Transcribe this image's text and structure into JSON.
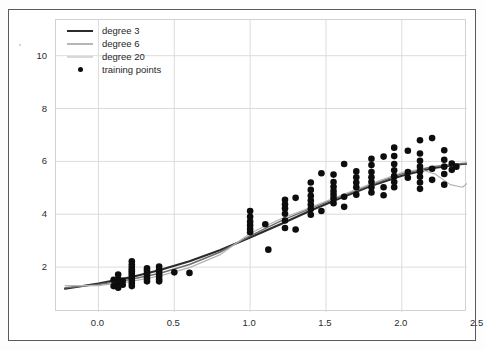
{
  "chart_data": {
    "type": "scatter",
    "title": "",
    "xlabel": "",
    "ylabel": "",
    "xlim": [
      -0.28,
      2.43
    ],
    "ylim": [
      0.3,
      11.35
    ],
    "xticks": [
      0.0,
      0.5,
      1.0,
      1.5,
      2.0,
      2.5
    ],
    "xtick_labels": [
      "0.0",
      "0.5",
      "1.0",
      "1.5",
      "2.0",
      "2.5"
    ],
    "yticks": [
      2,
      4,
      6,
      8,
      10
    ],
    "ytick_labels": [
      "2",
      "4",
      "6",
      "8",
      "10"
    ],
    "grid": true,
    "legend_position": "upper left",
    "legend": [
      {
        "label": "degree 3",
        "color": "#2b2b2b",
        "width": 2.1,
        "marker": "line"
      },
      {
        "label": "degree 6",
        "color": "#6e6e6e",
        "width": 1.5,
        "marker": "line"
      },
      {
        "label": "degree 20",
        "color": "#b4b4b4",
        "width": 1.2,
        "marker": "line"
      },
      {
        "label": "training points",
        "color": "#0d0d0d",
        "marker": "point"
      }
    ],
    "scatter": {
      "name": "training points",
      "color": "#0d0d0d",
      "size": 4.6,
      "x": [
        0.1,
        0.1,
        0.13,
        0.13,
        0.13,
        0.13,
        0.16,
        0.16,
        0.22,
        0.22,
        0.22,
        0.22,
        0.22,
        0.22,
        0.22,
        0.22,
        0.22,
        0.22,
        0.22,
        0.32,
        0.32,
        0.32,
        0.32,
        0.32,
        0.32,
        0.4,
        0.4,
        0.4,
        0.4,
        0.4,
        0.4,
        0.4,
        0.5,
        0.6,
        1.0,
        1.0,
        1.0,
        1.0,
        1.0,
        1.0,
        1.1,
        1.12,
        1.23,
        1.23,
        1.23,
        1.23,
        1.23,
        1.23,
        1.3,
        1.3,
        1.4,
        1.4,
        1.4,
        1.4,
        1.4,
        1.4,
        1.4,
        1.47,
        1.47,
        1.55,
        1.55,
        1.55,
        1.55,
        1.55,
        1.55,
        1.55,
        1.62,
        1.62,
        1.62,
        1.7,
        1.7,
        1.7,
        1.7,
        1.7,
        1.8,
        1.8,
        1.8,
        1.8,
        1.8,
        1.8,
        1.8,
        1.88,
        1.88,
        1.88,
        1.95,
        1.95,
        1.95,
        1.95,
        1.95,
        1.95,
        1.95,
        2.04,
        2.04,
        2.04,
        2.12,
        2.12,
        2.12,
        2.12,
        2.12,
        2.12,
        2.12,
        2.12,
        2.2,
        2.2,
        2.2,
        2.28,
        2.28,
        2.28,
        2.28,
        2.28,
        2.33,
        2.33,
        2.36
      ],
      "y": [
        1.52,
        1.28,
        1.72,
        1.55,
        1.4,
        1.22,
        1.48,
        1.33,
        2.22,
        2.1,
        2.0,
        1.92,
        1.84,
        1.76,
        1.68,
        1.58,
        1.48,
        1.38,
        1.28,
        1.95,
        1.86,
        1.76,
        1.66,
        1.56,
        1.46,
        2.02,
        1.92,
        1.84,
        1.74,
        1.64,
        1.54,
        1.46,
        1.8,
        1.78,
        4.12,
        3.9,
        3.72,
        3.58,
        3.44,
        3.32,
        3.62,
        2.66,
        4.55,
        4.38,
        4.22,
        4.02,
        3.76,
        3.48,
        4.62,
        3.42,
        5.2,
        4.92,
        4.7,
        4.52,
        4.36,
        4.2,
        3.98,
        5.55,
        4.12,
        5.5,
        5.22,
        5.04,
        4.88,
        4.74,
        4.6,
        4.42,
        5.9,
        4.66,
        4.28,
        5.62,
        5.4,
        5.2,
        5.02,
        4.74,
        6.1,
        5.86,
        5.6,
        5.4,
        5.22,
        5.02,
        4.82,
        6.18,
        5.02,
        4.72,
        6.52,
        6.2,
        5.9,
        5.66,
        5.44,
        5.22,
        5.02,
        6.4,
        5.6,
        5.38,
        6.8,
        6.3,
        6.02,
        5.8,
        5.62,
        5.42,
        5.2,
        4.96,
        6.88,
        5.72,
        5.3,
        6.42,
        6.06,
        5.8,
        5.52,
        5.12,
        5.92,
        5.68,
        5.8
      ]
    },
    "series": [
      {
        "name": "degree 3",
        "color": "#2b2b2b",
        "width": 2.1,
        "x": [
          -0.22,
          0.0,
          0.2,
          0.4,
          0.6,
          0.8,
          1.0,
          1.2,
          1.4,
          1.6,
          1.8,
          2.0,
          2.2,
          2.4,
          2.55,
          2.66,
          2.78
        ],
        "y": [
          1.18,
          1.38,
          1.6,
          1.88,
          2.22,
          2.64,
          3.12,
          3.62,
          4.14,
          4.62,
          5.08,
          5.46,
          5.74,
          5.9,
          5.94,
          5.93,
          5.9
        ]
      },
      {
        "name": "degree 6",
        "color": "#6e6e6e",
        "width": 1.5,
        "x": [
          -0.22,
          0.0,
          0.2,
          0.4,
          0.6,
          0.8,
          1.0,
          1.2,
          1.4,
          1.6,
          1.8,
          2.0,
          2.2,
          2.4,
          2.55,
          2.66,
          2.78
        ],
        "y": [
          1.22,
          1.34,
          1.52,
          1.76,
          2.1,
          2.56,
          3.18,
          3.74,
          4.22,
          4.68,
          5.12,
          5.52,
          5.8,
          5.92,
          5.9,
          5.84,
          5.8
        ]
      },
      {
        "name": "degree 20",
        "color": "#b4b4b4",
        "width": 1.2,
        "x": [
          -0.22,
          0.0,
          0.2,
          0.4,
          0.6,
          0.8,
          1.0,
          1.2,
          1.4,
          1.6,
          1.8,
          2.0,
          2.12,
          2.22,
          2.32,
          2.4,
          2.46,
          2.52,
          2.56,
          2.6,
          2.64,
          2.68,
          2.72
        ],
        "y": [
          1.3,
          1.3,
          1.44,
          1.66,
          1.98,
          2.46,
          3.28,
          3.82,
          4.26,
          4.72,
          5.16,
          5.58,
          5.7,
          5.52,
          5.12,
          5.02,
          5.3,
          5.92,
          6.4,
          7.6,
          9.1,
          10.6,
          11.35
        ]
      }
    ]
  }
}
